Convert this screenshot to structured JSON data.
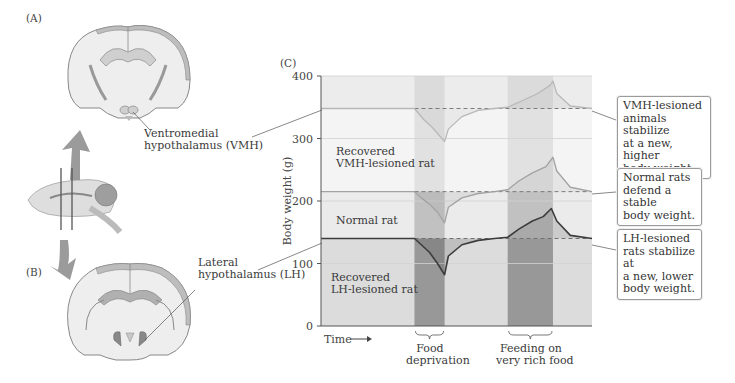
{
  "panels": {
    "a_label": "(A)",
    "b_label": "(B)",
    "c_label": "(C)"
  },
  "brain_labels": {
    "vmh": [
      "Ventromedial",
      "hypothalamus (VMH)"
    ],
    "lh": [
      "Lateral",
      "hypothalamus (LH)"
    ]
  },
  "colors": {
    "vmh_line": "#b8b8b8",
    "normal_line": "#a2a2a2",
    "lh_line": "#3c3c3c",
    "band_dark": "#8e8e8e",
    "bg_light": "#ececec"
  },
  "callouts": {
    "vmh": [
      "VMH-lesioned",
      "animals stabilize",
      "at a new, higher",
      "body weight."
    ],
    "normal": [
      "Normal rats",
      "defend a stable",
      "body weight."
    ],
    "lh": [
      "LH-lesioned",
      "rats stabilize at",
      "a new, lower",
      "body weight."
    ]
  },
  "chart_data": {
    "type": "line",
    "title": "",
    "xlabel": "Time",
    "ylabel": "Body weight (g)",
    "ylim": [
      0,
      400
    ],
    "yticks": [
      0,
      100,
      200,
      300,
      400
    ],
    "ytick_labels": [
      "0",
      "100",
      "200",
      "300",
      "400"
    ],
    "grid": true,
    "x_units": "relative time (0–1)",
    "intervals": [
      {
        "name": "Food deprivation",
        "label": [
          "Food",
          "deprivation"
        ],
        "start": 0.345,
        "end": 0.456
      },
      {
        "name": "Feeding on very rich food",
        "label": [
          "Feeding on",
          "very rich food"
        ],
        "start": 0.689,
        "end": 0.856
      }
    ],
    "series": [
      {
        "name": "Recovered VMH-lesioned rat",
        "label": [
          "Recovered",
          "VMH-lesioned rat"
        ],
        "baseline": 348,
        "x": [
          0,
          0.345,
          0.38,
          0.41,
          0.456,
          0.47,
          0.52,
          0.58,
          0.64,
          0.689,
          0.74,
          0.8,
          0.845,
          0.856,
          0.87,
          0.92,
          1.0
        ],
        "values": [
          348,
          348,
          330,
          318,
          295,
          315,
          335,
          345,
          348,
          350,
          360,
          372,
          385,
          392,
          372,
          352,
          348
        ]
      },
      {
        "name": "Normal rat",
        "label": [
          "Normal rat"
        ],
        "baseline": 215,
        "x": [
          0,
          0.345,
          0.37,
          0.4,
          0.43,
          0.456,
          0.47,
          0.52,
          0.58,
          0.64,
          0.689,
          0.73,
          0.78,
          0.83,
          0.856,
          0.87,
          0.92,
          1.0
        ],
        "values": [
          215,
          215,
          205,
          195,
          182,
          165,
          190,
          205,
          212,
          215,
          218,
          232,
          245,
          255,
          270,
          248,
          222,
          215
        ],
        "style": "reference"
      },
      {
        "name": "Recovered LH-lesioned rat",
        "label": [
          "Recovered",
          "LH-lesioned rat"
        ],
        "baseline": 140,
        "x": [
          0,
          0.345,
          0.37,
          0.4,
          0.43,
          0.456,
          0.47,
          0.52,
          0.58,
          0.64,
          0.689,
          0.73,
          0.78,
          0.82,
          0.85,
          0.87,
          0.92,
          1.0
        ],
        "values": [
          140,
          140,
          130,
          118,
          100,
          82,
          112,
          130,
          137,
          140,
          142,
          155,
          168,
          175,
          188,
          168,
          145,
          140
        ]
      }
    ],
    "dashed_reference_lines": [
      348,
      215,
      140
    ]
  }
}
